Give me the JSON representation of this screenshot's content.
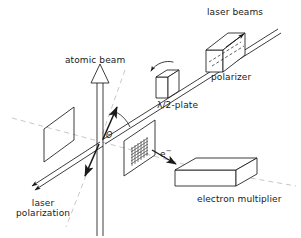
{
  "figure": {
    "background_color": "#ffffff",
    "line_color": "#1a1a1a",
    "dashed_color": "#b9b9b9"
  },
  "labels": {
    "laser_beams": "laser beams",
    "polarizer": "polarizer",
    "half_wave_plate": "λ/2-plate",
    "atomic_beam": "atomic beam",
    "electron": "e",
    "electron_superscript": "−",
    "electron_multiplier": "electron multiplier",
    "laser_polarization_line1": "laser",
    "laser_polarization_line2": "polarization",
    "angle_theta": "Θ"
  },
  "components": [
    {
      "name": "polarizer",
      "shape": "3d-box",
      "label": "polarizer",
      "position": "upper-right"
    },
    {
      "name": "half-wave-plate",
      "shape": "3d-box",
      "label": "λ/2-plate",
      "position": "upper-right-center",
      "annotation": "curved rotation arrow"
    },
    {
      "name": "electron-multiplier",
      "shape": "3d-box",
      "label": "electron multiplier",
      "position": "lower-right"
    },
    {
      "name": "detector-grid",
      "shape": "parallelogram-panel-with-mesh",
      "position": "center-right"
    },
    {
      "name": "left-panel",
      "shape": "parallelogram-panel",
      "position": "center-left"
    }
  ],
  "beams": [
    {
      "name": "laser-beam",
      "style": "double-line",
      "direction": "upper-right to lower-left",
      "arrowheads": "both-ends"
    },
    {
      "name": "atomic-beam",
      "style": "double-line-vertical",
      "direction": "upward",
      "arrowheads": "hollow-triangle-top"
    },
    {
      "name": "laser-polarization",
      "style": "solid-arrow",
      "direction": "bidirectional-diagonal"
    }
  ]
}
